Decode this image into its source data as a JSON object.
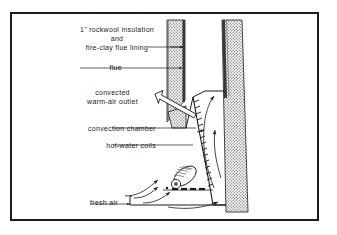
{
  "figure": {
    "frame_color": "#1c1c1c",
    "background_color": "#ffffff",
    "line_color": "#1a1a1a",
    "masonry_fill": "#b9b9b9",
    "lining_fill": "#3a3a3a"
  },
  "labels": {
    "insulation_line1": "1\" rockwool insulation",
    "insulation_line2": "and",
    "insulation_line3": "fire-clay flue lining",
    "flue": "flue",
    "outlet_line1": "convected",
    "outlet_line2": "warm-air  outlet",
    "convection_chamber": "convection chamber",
    "hot_water_coils": "hot-water coils",
    "fresh_air": "fresh air"
  }
}
